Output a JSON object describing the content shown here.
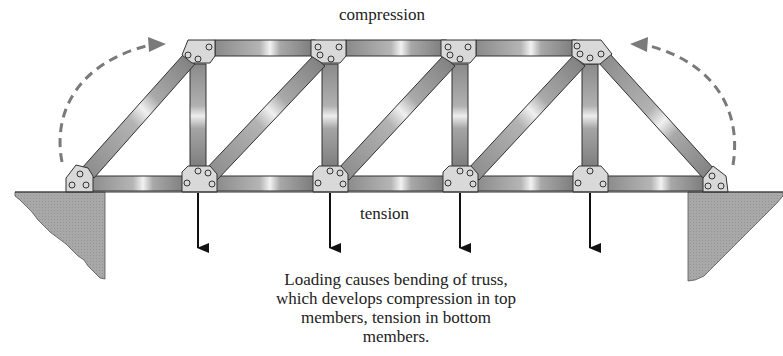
{
  "labels": {
    "top": "compression",
    "bottom": "tension"
  },
  "caption": {
    "lines": [
      "Loading causes bending of truss,",
      "which develops compression in top",
      "members, tension in bottom",
      "members."
    ]
  },
  "diagram": {
    "type": "pratt-style truss bridge",
    "top_nodes_x": [
      198,
      330,
      460,
      590
    ],
    "bottom_nodes_x": [
      80,
      198,
      330,
      460,
      590,
      715
    ],
    "load_arrows": 4,
    "rotation_arrows": [
      "left-clockwise",
      "right-counterclockwise"
    ],
    "colors": {
      "member_dark": "#6e6e6e",
      "member_light": "#e6e6e6",
      "gusset": "#d8d8d8",
      "ground": "#a9a9a9",
      "dash": "#7a7a7a",
      "arrow": "#111111"
    }
  }
}
